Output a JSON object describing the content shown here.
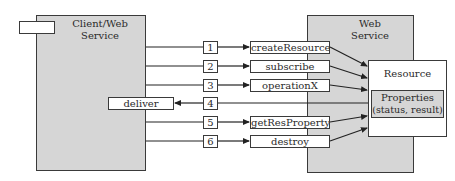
{
  "client": {
    "title_line1": "Client/Web",
    "title_line2": "Service"
  },
  "server": {
    "title_line1": "Web",
    "title_line2": "Service"
  },
  "resource": {
    "title": "Resource",
    "properties_line1": "Properties",
    "properties_line2": "(status, result)"
  },
  "callback": {
    "label": "deliver"
  },
  "steps": [
    {
      "number": "1",
      "method": "createResource",
      "direction": "client-to-service"
    },
    {
      "number": "2",
      "method": "subscribe",
      "direction": "client-to-service"
    },
    {
      "number": "3",
      "method": "operationX",
      "direction": "client-to-service"
    },
    {
      "number": "4",
      "method": "deliver",
      "direction": "service-to-client"
    },
    {
      "number": "5",
      "method": "getResProperty",
      "direction": "client-to-service"
    },
    {
      "number": "6",
      "method": "destroy",
      "direction": "client-to-service"
    }
  ]
}
